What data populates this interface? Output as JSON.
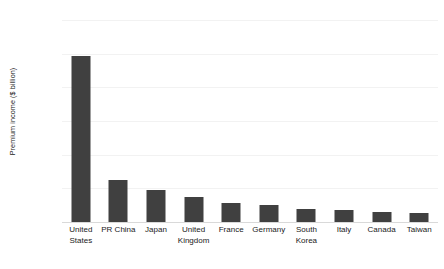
{
  "chart_data": {
    "type": "bar",
    "title": "",
    "subtitle": "",
    "xlabel": "",
    "ylabel": "Premium income ($ billion)",
    "ylim": [
      0,
      3000
    ],
    "ytick_values": [
      0,
      500,
      1000,
      1500,
      2000,
      2500,
      3000
    ],
    "ytick_labels": [
      "0",
      "500",
      "1,000",
      "1,500",
      "2,000",
      "2,500",
      "3,000"
    ],
    "grid": true,
    "legend": false,
    "legend_position": "none",
    "bar_color": "#404040",
    "gridline_color": "#f2f2f2",
    "axis_color": "#d9d9d9",
    "categories": [
      "United States",
      "PR China",
      "Japan",
      "United Kingdom",
      "France",
      "Germany",
      "South Korea",
      "Italy",
      "Canada",
      "Taiwan"
    ],
    "category_lines": [
      [
        "United",
        "States"
      ],
      [
        "PR China"
      ],
      [
        "Japan"
      ],
      [
        "United",
        "Kingdom"
      ],
      [
        "France"
      ],
      [
        "Germany"
      ],
      [
        "South",
        "Korea"
      ],
      [
        "Italy"
      ],
      [
        "Canada"
      ],
      [
        "Taiwan"
      ]
    ],
    "values": [
      2460,
      620,
      470,
      375,
      275,
      260,
      190,
      185,
      155,
      140
    ]
  }
}
